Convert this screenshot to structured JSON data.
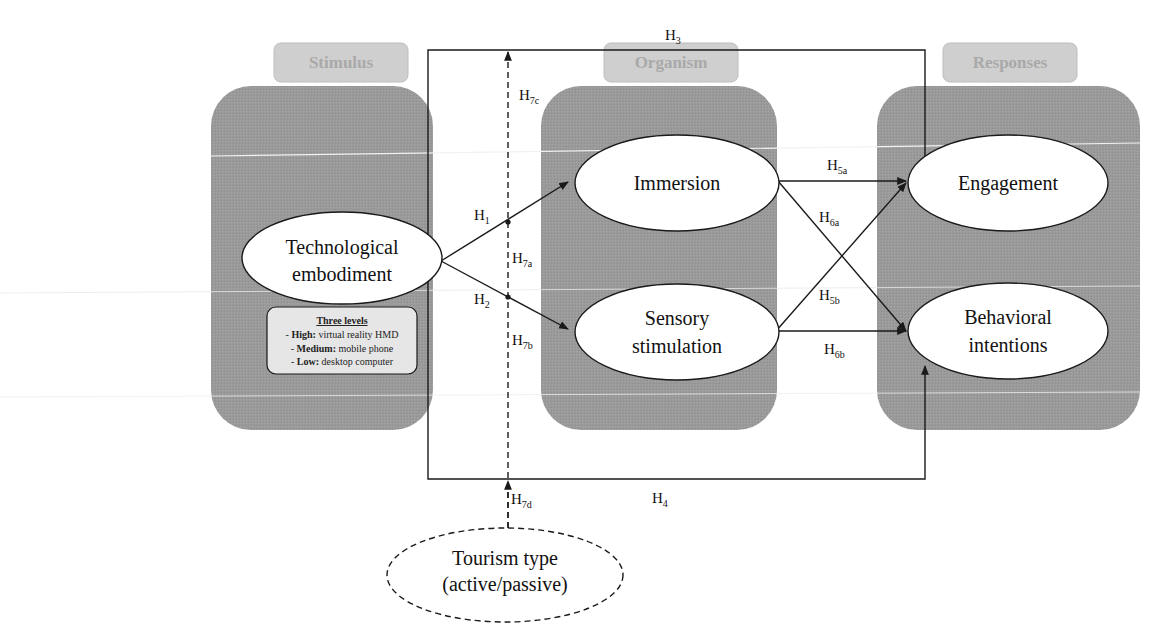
{
  "panels": [
    {
      "id": "stimulus",
      "title": "Stimulus"
    },
    {
      "id": "organism",
      "title": "Organism"
    },
    {
      "id": "responses",
      "title": "Responses"
    }
  ],
  "nodes": {
    "tech": {
      "line1": "Technological",
      "line2": "embodiment"
    },
    "immersion": {
      "line1": "Immersion"
    },
    "sensory": {
      "line1": "Sensory",
      "line2": "stimulation"
    },
    "engagement": {
      "line1": "Engagement"
    },
    "behavioral": {
      "line1": "Behavioral",
      "line2": "intentions"
    },
    "tourism": {
      "line1": "Tourism type",
      "line2": "(active/passive)"
    }
  },
  "levels_box": {
    "title": "Three levels",
    "items": [
      {
        "bold": "High:",
        "text": " virtual reality HMD"
      },
      {
        "bold": "Medium:",
        "text": " mobile phone"
      },
      {
        "bold": "Low:",
        "text": " desktop computer"
      }
    ],
    "prefix": "- "
  },
  "hypotheses": {
    "h1": {
      "main": "H",
      "sub": "1"
    },
    "h2": {
      "main": "H",
      "sub": "2"
    },
    "h3": {
      "main": "H",
      "sub": "3"
    },
    "h4": {
      "main": "H",
      "sub": "4"
    },
    "h5a": {
      "main": "H",
      "sub": "5a"
    },
    "h5b": {
      "main": "H",
      "sub": "5b"
    },
    "h6a": {
      "main": "H",
      "sub": "6a"
    },
    "h6b": {
      "main": "H",
      "sub": "6b"
    },
    "h7a": {
      "main": "H",
      "sub": "7a"
    },
    "h7b": {
      "main": "H",
      "sub": "7b"
    },
    "h7c": {
      "main": "H",
      "sub": "7c"
    },
    "h7d": {
      "main": "H",
      "sub": "7d"
    }
  },
  "colors": {
    "panel_fill": "#9a9a9a",
    "panel_title_fill": "#cfcfcf",
    "panel_title_text": "#a9a9a9",
    "node_fill": "#ffffff",
    "line": "#1a1a1a",
    "levels_fill": "#e6e6e6"
  }
}
